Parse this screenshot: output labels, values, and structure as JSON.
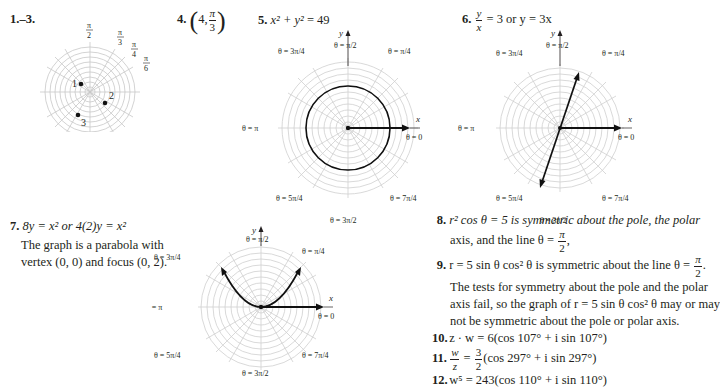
{
  "items": {
    "i1_3": {
      "label": "1.–3.",
      "points": [
        "1",
        "2",
        "3"
      ],
      "angle_labels": [
        "π/2",
        "π/3",
        "π/4",
        "π/6"
      ]
    },
    "i4": {
      "label": "4.",
      "r": "4",
      "theta_num": "π",
      "theta_den": "3"
    },
    "i5": {
      "label": "5.",
      "equation_lhs": "x² + y²",
      "equation_rhs": "= 49"
    },
    "i6": {
      "label": "6.",
      "frac_num": "y",
      "frac_den": "x",
      "rest": "= 3 or y = 3x"
    },
    "i7": {
      "label": "7.",
      "equation": "8y = x² or 4(2)y = x²",
      "text_line1": "The graph is a parabola with",
      "text_line2": "vertex (0, 0) and focus (0, 2)."
    },
    "i8": {
      "label": "8.",
      "line1": "r² cos θ = 5 is symmetric about the pole, the polar",
      "line2_prefix": "axis, and the line θ =",
      "line2_num": "π",
      "line2_den": "2",
      "line2_suffix": ","
    },
    "i9": {
      "label": "9.",
      "line1_prefix": "r = 5 sin θ cos² θ is symmetric about the line θ =",
      "line1_num": "π",
      "line1_den": "2",
      "line1_suffix": ".",
      "line2": "The tests for symmetry about the pole and the polar",
      "line3": "axis fail, so the graph of r = 5 sin θ cos² θ may or may",
      "line4": "not be symmetric about the pole or polar axis."
    },
    "i10": {
      "label": "10.",
      "text": "z · w = 6(cos 107° + i sin 107°)"
    },
    "i11": {
      "label": "11.",
      "frac1_num": "w",
      "frac1_den": "z",
      "eq": "=",
      "frac2_num": "3",
      "frac2_den": "2",
      "rest": "(cos 297° + i sin 297°)"
    },
    "i12": {
      "label": "12.",
      "text": "w⁵ = 243(cos 110° + i sin 110°)"
    }
  },
  "polar_labels": {
    "y_axis": "y",
    "x_axis": "x",
    "theta_0": "θ = 0",
    "theta_pi": "θ = π",
    "theta_pi_2": "θ = π/2",
    "theta_pi_4": "θ = π/4",
    "theta_3pi_4": "θ = 3π/4",
    "theta_5pi_4": "θ = 5π/4",
    "theta_3pi_2": "θ = 3π/2",
    "theta_7pi_4": "θ = 7π/4"
  },
  "colors": {
    "text": "#231f20",
    "grid": "#c8c8c8",
    "curve": "#111111"
  }
}
